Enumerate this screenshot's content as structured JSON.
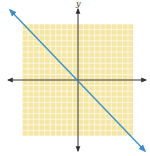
{
  "chart_data": {
    "type": "line",
    "title": "",
    "xlabel": "",
    "ylabel": "y",
    "grid": true,
    "grid_color": "#f5e6a3",
    "grid_line_color": "#ffffff",
    "axis_color": "#333333",
    "line_color": "#3a8fc7",
    "xlim": [
      -10,
      10
    ],
    "ylim": [
      -10,
      10
    ],
    "series": [
      {
        "name": "line",
        "x": [
          -12,
          12
        ],
        "y": [
          12,
          -12
        ]
      }
    ],
    "legend": null
  },
  "labels": {
    "y_axis": "y"
  }
}
